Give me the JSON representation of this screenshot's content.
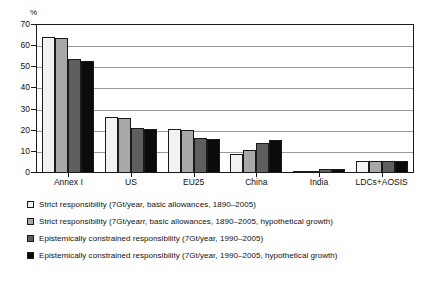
{
  "chart_data": {
    "type": "bar",
    "title": "",
    "subtitle": "",
    "xlabel": "",
    "ylabel": "%",
    "unit_label": "%",
    "ylim": [
      0,
      70
    ],
    "yticks": [
      0,
      10,
      20,
      30,
      40,
      50,
      60,
      70
    ],
    "ytick_labels": [
      "0",
      "10",
      "20",
      "30",
      "40",
      "50",
      "60",
      "70"
    ],
    "grid": true,
    "grid_axis": "y",
    "legend_position": "below",
    "categories": [
      "Annex I",
      "US",
      "EU25",
      "China",
      "India",
      "LDCs+AOSIS"
    ],
    "series": [
      {
        "name": "Strict responsibility (7Gt/year, basic allowances, 1890–2005)",
        "color": "#f2f2f0",
        "values": [
          64,
          26,
          20.5,
          8.5,
          0.4,
          5.2
        ]
      },
      {
        "name": "Strict responsibility (7Gt/yearr, basic allowances, 1890–2005, hypothetical growth)",
        "color": "#a8a8a6",
        "values": [
          63.5,
          25.5,
          20,
          10.5,
          0.6,
          5.2
        ]
      },
      {
        "name": "Epistemically constrained responsibility (7Gt/year, 1990–2005)",
        "color": "#5f5f5d",
        "values": [
          53.5,
          21,
          16,
          13.5,
          1.4,
          5.0
        ]
      },
      {
        "name": "Epistemically constrained responsibility (7Gt/year, 1990–2005, hypothetical growth)",
        "color": "#0b0b0b",
        "values": [
          52.5,
          20.5,
          15.5,
          15,
          1.5,
          5.0
        ]
      }
    ]
  },
  "legend": {
    "items": [
      {
        "label": "Strict responsibility (7Gt/year, basic allowances, 1890–2005)",
        "swatch": "#f2f2f0"
      },
      {
        "label": "Strict responsibility (7Gt/yearr, basic allowances, 1890–2005, hypothetical growth)",
        "swatch": "#a8a8a6"
      },
      {
        "label": "Epistemically constrained responsibility (7Gt/year, 1990–2005)",
        "swatch": "#5f5f5d"
      },
      {
        "label": "Epistemically constrained responsibility (7Gt/year, 1990–2005, hypothetical growth)",
        "swatch": "#0b0b0b"
      }
    ]
  }
}
